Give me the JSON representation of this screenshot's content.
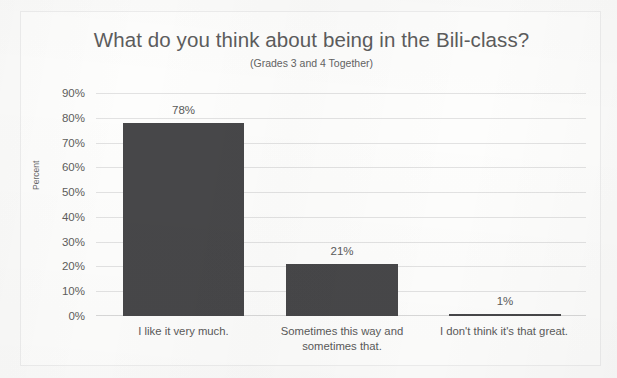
{
  "chart_data": {
    "type": "bar",
    "title": "What do you think about being in the Bili-class?",
    "subtitle": "(Grades 3 and 4 Together)",
    "xlabel": "",
    "ylabel": "Percent",
    "ylim": [
      0,
      90
    ],
    "ytick_labels": [
      "90%",
      "80%",
      "70%",
      "60%",
      "50%",
      "40%",
      "30%",
      "20%",
      "10%",
      "0%"
    ],
    "ytick_values": [
      90,
      80,
      70,
      60,
      50,
      40,
      30,
      20,
      10,
      0
    ],
    "grid": true,
    "legend": "none",
    "categories": [
      "I like it very much.",
      "Sometimes this way and sometimes that.",
      "I don't think it's that great."
    ],
    "values": [
      78,
      21,
      1
    ],
    "value_labels": [
      "78%",
      "21%",
      "1%"
    ],
    "bar_color": "#474749",
    "text_color": "#5a5a5a",
    "gridline_color": "#e2e2e2",
    "background_color": "#fdfdfc"
  }
}
